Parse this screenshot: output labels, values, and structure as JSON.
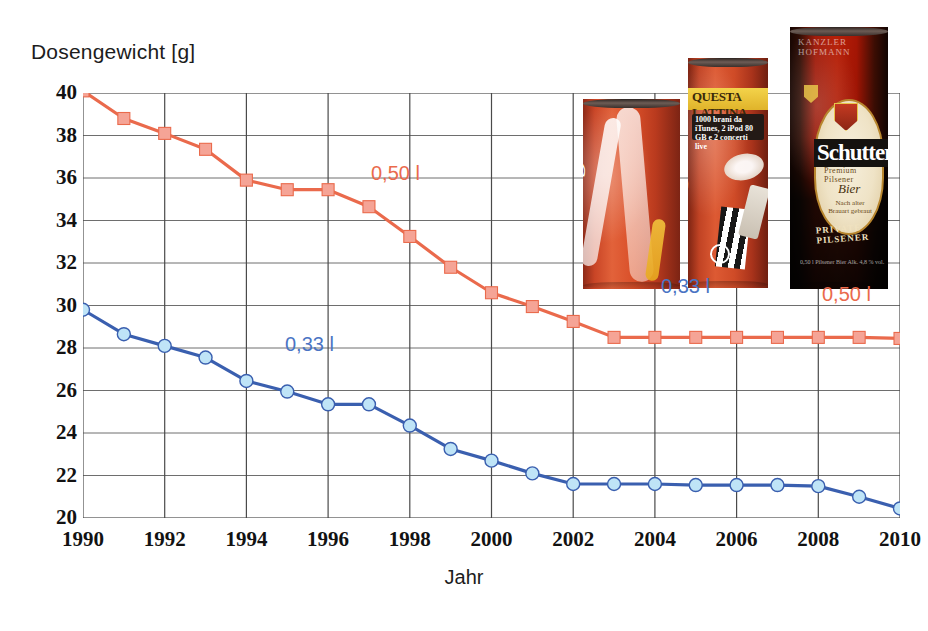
{
  "chart_data": {
    "type": "line",
    "title": "",
    "ylabel": "Dosengewicht [g]",
    "xlabel": "Jahr",
    "ylim": [
      20,
      40
    ],
    "xlim": [
      1990,
      2010
    ],
    "ytick_step": 2,
    "xtick_step": 2,
    "grid": true,
    "legend_position": "inline-annotation",
    "x": [
      1990,
      1991,
      1992,
      1993,
      1994,
      1995,
      1996,
      1997,
      1998,
      1999,
      2000,
      2001,
      2002,
      2003,
      2004,
      2005,
      2006,
      2007,
      2008,
      2009,
      2010
    ],
    "yticks": [
      20,
      22,
      24,
      26,
      28,
      30,
      32,
      34,
      36,
      38,
      40
    ],
    "xticks": [
      1990,
      1992,
      1994,
      1996,
      1998,
      2000,
      2002,
      2004,
      2006,
      2008,
      2010
    ],
    "series": [
      {
        "name": "0,50 l",
        "color": "#ea6a4c",
        "marker": "square",
        "marker_color": "#f5a496",
        "values": [
          40.1,
          38.8,
          38.1,
          37.35,
          35.9,
          35.45,
          35.45,
          34.65,
          33.25,
          31.8,
          30.6,
          29.95,
          29.25,
          28.5,
          28.5,
          28.5,
          28.5,
          28.5,
          28.5,
          28.5,
          28.45
        ]
      },
      {
        "name": "0,33 l",
        "color": "#3a5faf",
        "marker": "circle",
        "marker_color": "#bfe4f7",
        "values": [
          29.8,
          28.65,
          28.1,
          27.55,
          26.45,
          25.95,
          25.35,
          25.35,
          24.35,
          23.25,
          22.7,
          22.1,
          21.6,
          21.6,
          21.6,
          21.55,
          21.55,
          21.55,
          21.5,
          21.0,
          20.45
        ]
      }
    ]
  },
  "annotations": {
    "series_050_label": "0,50 l",
    "series_033_label": "0,33 l",
    "can_label_033": "0,33 l",
    "can_label_050": "0,50 l"
  },
  "cans": [
    {
      "name": "coca-cola-033-can",
      "brand": "Coca-Cola",
      "script_text": "Coca-Cola"
    },
    {
      "name": "coca-cola-questa-lattina-can",
      "brand": "Coca-Cola",
      "banner_text": "QUESTA LATTINA",
      "sub_text": "1000 brani da iTunes, 2 iPod 80 GB e 2 concerti live",
      "script_text": "Coca-Cola"
    },
    {
      "name": "schutter-bier-can",
      "brand": "Schutter",
      "top_text": "KANZLER HOFMANN",
      "label_text": "Schutter",
      "sub_label": "Premium Pilsener",
      "bier_text": "Bier",
      "bottom_text": "PRIVATE PILSENER"
    }
  ]
}
